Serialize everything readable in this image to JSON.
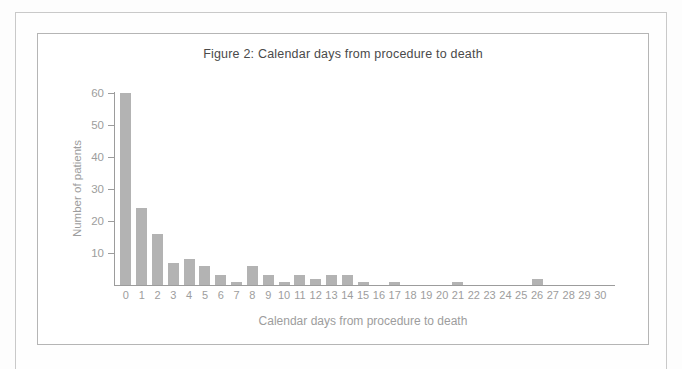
{
  "page": {
    "background": "#fdfdfd",
    "frame_border_color": "#c9c9c9",
    "panel_border_color": "#b5b5b5"
  },
  "chart_data": {
    "type": "bar",
    "title": "Figure 2: Calendar days from procedure to death",
    "xlabel": "Calendar days from procedure to death",
    "ylabel": "Number of patients",
    "categories": [
      0,
      1,
      2,
      3,
      4,
      5,
      6,
      7,
      8,
      9,
      10,
      11,
      12,
      13,
      14,
      15,
      16,
      17,
      18,
      19,
      20,
      21,
      22,
      23,
      24,
      25,
      26,
      27,
      28,
      29,
      30
    ],
    "values": [
      60,
      24,
      16,
      7,
      8,
      6,
      3,
      1,
      6,
      3,
      1,
      3,
      2,
      3,
      3,
      1,
      0,
      1,
      0,
      0,
      0,
      1,
      0,
      0,
      0,
      0,
      2,
      0,
      0,
      0,
      0
    ],
    "ylim": [
      0,
      60
    ],
    "yticks": [
      10,
      20,
      30,
      40,
      50,
      60
    ],
    "grid": false,
    "legend_position": "none",
    "bar_color": "#b3b3b3",
    "axis_color": "#9c9c9c",
    "text_color": "#9d9d9d",
    "title_color": "#4a4a4a"
  }
}
